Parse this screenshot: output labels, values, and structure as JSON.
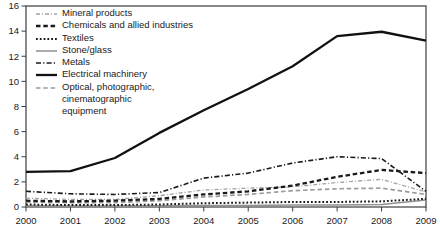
{
  "figure": {
    "background": "#ffffff",
    "border_color": "#3c3c3c",
    "text_color": "#1a1a1a"
  },
  "axes": {
    "y_ticks": [
      0,
      2,
      4,
      6,
      8,
      10,
      12,
      14,
      16
    ],
    "grid": false
  },
  "chart_data": {
    "type": "line",
    "x": [
      2000,
      2001,
      2002,
      2003,
      2004,
      2005,
      2006,
      2007,
      2008,
      2009
    ],
    "ylim": [
      0,
      16
    ],
    "legend_position": "top-left-inside",
    "series": [
      {
        "key": "mineral-products",
        "name": "Mineral products",
        "color": "#a3a3a3",
        "style": "dash-dot",
        "dash": "4 2 1 2",
        "width": 1.3,
        "values": [
          0.7,
          0.6,
          0.6,
          0.9,
          1.35,
          1.5,
          1.6,
          1.95,
          2.2,
          1.2
        ]
      },
      {
        "key": "chemicals",
        "name": "Chemicals and allied industries",
        "color": "#1a1a1a",
        "style": "dashed",
        "dash": "4.5 2.8",
        "width": 2.3,
        "values": [
          0.5,
          0.45,
          0.5,
          0.65,
          1.0,
          1.25,
          1.7,
          2.4,
          2.95,
          2.7
        ]
      },
      {
        "key": "textiles",
        "name": "Textiles",
        "color": "#1a1a1a",
        "style": "dotted",
        "dash": "1.8 2",
        "width": 2.0,
        "values": [
          0.2,
          0.15,
          0.15,
          0.2,
          0.3,
          0.35,
          0.4,
          0.4,
          0.45,
          0.65
        ]
      },
      {
        "key": "stone-glass",
        "name": "Stone/glass",
        "color": "#8f8f8f",
        "style": "solid",
        "dash": "",
        "width": 1.5,
        "values": [
          0.1,
          0.08,
          0.08,
          0.1,
          0.12,
          0.12,
          0.15,
          0.15,
          0.2,
          0.55
        ]
      },
      {
        "key": "metals",
        "name": "Metals",
        "color": "#1a1a1a",
        "style": "dash-dot",
        "dash": "5 2.2 1.2 2.2",
        "width": 1.6,
        "values": [
          1.25,
          1.05,
          1.0,
          1.15,
          2.3,
          2.7,
          3.5,
          4.0,
          3.85,
          1.25
        ]
      },
      {
        "key": "electrical-machinery",
        "name": "Electrical machinery",
        "color": "#111111",
        "style": "solid",
        "dash": "",
        "width": 2.3,
        "values": [
          2.8,
          2.85,
          3.9,
          5.9,
          7.7,
          9.4,
          11.2,
          13.6,
          13.95,
          13.25
        ]
      },
      {
        "key": "optical-photographic",
        "name": "Optical, photographic, cinematographic equipment",
        "legend_lines": [
          "Optical, photographic,",
          "cinematographic",
          "equipment"
        ],
        "color": "#9b9b9b",
        "style": "dashed",
        "dash": "4.5 2.8",
        "width": 1.7,
        "values": [
          0.4,
          0.35,
          0.35,
          0.5,
          0.8,
          1.0,
          1.3,
          1.45,
          1.5,
          1.0
        ]
      }
    ]
  }
}
